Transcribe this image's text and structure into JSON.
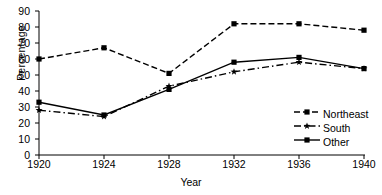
{
  "chart_data": {
    "type": "line",
    "title": "",
    "xlabel": "Year",
    "ylabel": "Percentage",
    "x": [
      1920,
      1924,
      1928,
      1932,
      1936,
      1940
    ],
    "categories": [
      "1920",
      "1924",
      "1928",
      "1932",
      "1936",
      "1940"
    ],
    "xlim": [
      1920,
      1940
    ],
    "ylim": [
      0,
      90
    ],
    "yticks": [
      0,
      10,
      20,
      30,
      40,
      50,
      60,
      70,
      80,
      90
    ],
    "xticks": [
      1920,
      1924,
      1928,
      1932,
      1936,
      1940
    ],
    "grid": false,
    "legend_position": "lower-right",
    "series": [
      {
        "name": "Northeast",
        "values": [
          60,
          67,
          51,
          82,
          82,
          78
        ],
        "linestyle": "dashed",
        "marker": "square",
        "color": "#000000"
      },
      {
        "name": "South",
        "values": [
          28,
          24,
          43,
          52,
          58,
          54
        ],
        "linestyle": "dash-dot",
        "marker": "star",
        "color": "#000000"
      },
      {
        "name": "Other",
        "values": [
          33,
          25,
          41,
          58,
          61,
          54
        ],
        "linestyle": "solid",
        "marker": "square",
        "color": "#000000"
      }
    ]
  },
  "axis": {
    "ylabel": "Percentage",
    "xlabel": "Year",
    "ytick_labels": [
      "90",
      "80",
      "70",
      "60",
      "50",
      "40",
      "30",
      "20",
      "10",
      "0"
    ],
    "xtick_labels": [
      "1920",
      "1924",
      "1928",
      "1932",
      "1936",
      "1940"
    ]
  },
  "legend": {
    "entries": [
      {
        "label": "Northeast"
      },
      {
        "label": "South"
      },
      {
        "label": "Other"
      }
    ]
  }
}
